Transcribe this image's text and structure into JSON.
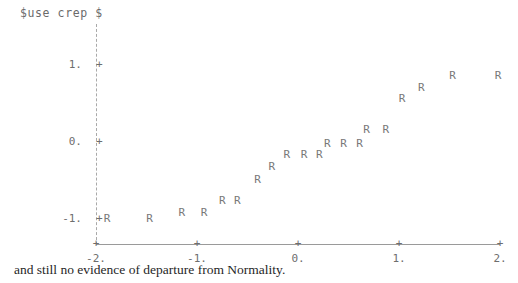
{
  "plot": {
    "title": "$use crep $",
    "caption": "and still no evidence of departure from Normality.",
    "point_glyph": "R",
    "axis_color": "#9a9a9a",
    "text_color": "#6e6e6e",
    "point_color": "#787878",
    "background": "#ffffff",
    "tick_mark": "+"
  },
  "chart_data": {
    "type": "scatter",
    "title": "$use crep $",
    "xlabel": "",
    "ylabel": "",
    "xlim": [
      -2,
      2
    ],
    "ylim": [
      -1.35,
      1.45
    ],
    "grid": false,
    "legend": null,
    "marker": "R",
    "xticks": [
      -2,
      -1,
      0,
      1,
      2
    ],
    "xticklabels": [
      "-2.",
      "-1.",
      "0.",
      "1.",
      "2."
    ],
    "yticks": [
      -1,
      0,
      1
    ],
    "yticklabels": [
      "-1.",
      "0.",
      "1."
    ],
    "points": [
      {
        "x": -1.89,
        "y": -1.07
      },
      {
        "x": -1.47,
        "y": -1.07
      },
      {
        "x": -1.15,
        "y": -0.99
      },
      {
        "x": -0.93,
        "y": -0.99
      },
      {
        "x": -0.75,
        "y": -0.83
      },
      {
        "x": -0.6,
        "y": -0.83
      },
      {
        "x": -0.4,
        "y": -0.56
      },
      {
        "x": -0.26,
        "y": -0.39
      },
      {
        "x": -0.11,
        "y": -0.24
      },
      {
        "x": 0.06,
        "y": -0.24
      },
      {
        "x": 0.21,
        "y": -0.24
      },
      {
        "x": 0.29,
        "y": -0.09
      },
      {
        "x": 0.45,
        "y": -0.09
      },
      {
        "x": 0.61,
        "y": -0.09
      },
      {
        "x": 0.68,
        "y": 0.09
      },
      {
        "x": 0.87,
        "y": 0.09
      },
      {
        "x": 1.03,
        "y": 0.49
      },
      {
        "x": 1.22,
        "y": 0.63
      },
      {
        "x": 1.53,
        "y": 0.79
      },
      {
        "x": 1.98,
        "y": 0.79
      }
    ]
  }
}
